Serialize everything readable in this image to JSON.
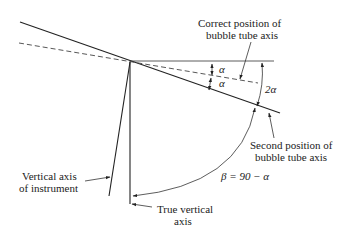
{
  "diagram": {
    "labels": {
      "correct_position_line1": "Correct position of",
      "correct_position_line2": "bubble tube axis",
      "second_position_line1": "Second position of",
      "second_position_line2": "bubble tube axis",
      "vertical_axis_line1": "Vertical axis",
      "vertical_axis_line2": "of instrument",
      "true_vertical_line1": "True vertical",
      "true_vertical_line2": "axis",
      "alpha_upper": "α",
      "alpha_lower": "α",
      "two_alpha": "2α",
      "beta_equation": "β = 90 − α"
    }
  }
}
